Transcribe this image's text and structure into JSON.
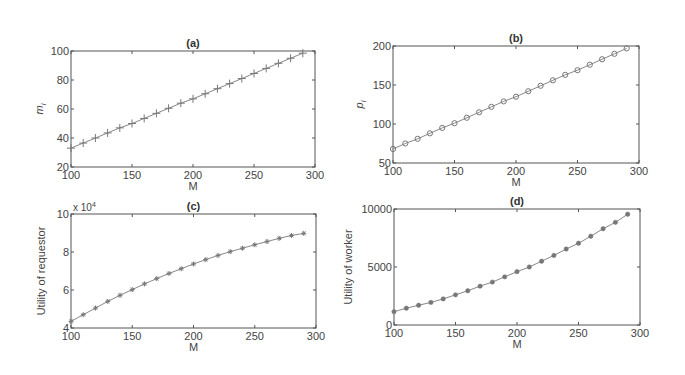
{
  "chart_data": [
    {
      "id": "a",
      "type": "line",
      "title": "(a)",
      "xlabel": "M",
      "ylabel": "m_i",
      "xlim": [
        100,
        300
      ],
      "ylim": [
        20,
        100
      ],
      "xticks": [
        100,
        150,
        200,
        250,
        300
      ],
      "yticks": [
        20,
        40,
        60,
        80,
        100
      ],
      "marker": "plus",
      "grid": false,
      "x": [
        100,
        110,
        120,
        130,
        140,
        150,
        160,
        170,
        180,
        190,
        200,
        210,
        220,
        230,
        240,
        250,
        260,
        270,
        280,
        290
      ],
      "values": [
        33,
        36.5,
        40,
        43.5,
        47,
        50,
        53.5,
        57,
        60.5,
        64,
        67,
        70.5,
        74,
        77.5,
        81,
        84.5,
        88,
        91.5,
        95,
        98.5
      ]
    },
    {
      "id": "b",
      "type": "line",
      "title": "(b)",
      "xlabel": "M",
      "ylabel": "p_i",
      "xlim": [
        100,
        300
      ],
      "ylim": [
        50,
        200
      ],
      "xticks": [
        100,
        150,
        200,
        250,
        300
      ],
      "yticks": [
        50,
        100,
        150,
        200
      ],
      "marker": "circle",
      "grid": false,
      "x": [
        100,
        110,
        120,
        130,
        140,
        150,
        160,
        170,
        180,
        190,
        200,
        210,
        220,
        230,
        240,
        250,
        260,
        270,
        280,
        290
      ],
      "values": [
        68,
        75,
        81,
        88,
        95,
        101,
        108,
        115,
        122,
        129,
        135,
        142,
        149,
        156,
        163,
        169,
        176,
        183,
        190,
        197
      ]
    },
    {
      "id": "c",
      "type": "line",
      "title": "(c)",
      "xlabel": "M",
      "ylabel": "Utility of requestor",
      "y_multiplier": "x 10",
      "y_multiplier_exp": "4",
      "xlim": [
        100,
        300
      ],
      "ylim": [
        4,
        10
      ],
      "xticks": [
        100,
        150,
        200,
        250,
        300
      ],
      "yticks": [
        4,
        6,
        8,
        10
      ],
      "marker": "asterisk",
      "grid": false,
      "x": [
        100,
        110,
        120,
        130,
        140,
        150,
        160,
        170,
        180,
        190,
        200,
        210,
        220,
        230,
        240,
        250,
        260,
        270,
        280,
        290
      ],
      "values": [
        4.35,
        4.7,
        5.05,
        5.4,
        5.72,
        6.02,
        6.32,
        6.6,
        6.87,
        7.12,
        7.37,
        7.6,
        7.82,
        8.02,
        8.2,
        8.38,
        8.55,
        8.72,
        8.87,
        8.98
      ]
    },
    {
      "id": "d",
      "type": "line",
      "title": "(d)",
      "xlabel": "M",
      "ylabel": "Utility of worker",
      "xlim": [
        100,
        300
      ],
      "ylim": [
        0,
        10000
      ],
      "xticks": [
        100,
        150,
        200,
        250,
        300
      ],
      "yticks": [
        0,
        5000,
        10000
      ],
      "marker": "dot",
      "grid": false,
      "x": [
        100,
        110,
        120,
        130,
        140,
        150,
        160,
        170,
        180,
        190,
        200,
        210,
        220,
        230,
        240,
        250,
        260,
        270,
        280,
        290
      ],
      "values": [
        1150,
        1450,
        1700,
        1950,
        2250,
        2600,
        2950,
        3350,
        3700,
        4150,
        4600,
        5000,
        5500,
        6000,
        6550,
        7050,
        7650,
        8300,
        8850,
        9550
      ]
    }
  ],
  "colors": {
    "axes": "#555555",
    "line": "#888888",
    "marker": "#777777",
    "text": "#333333"
  }
}
